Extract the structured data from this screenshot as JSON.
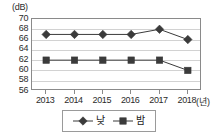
{
  "chart_data": {
    "type": "line",
    "title": "",
    "subtitle": "",
    "xlabel": "(년)",
    "ylabel": "(dB)",
    "categories": [
      "2013",
      "2014",
      "2015",
      "2016",
      "2017",
      "2018"
    ],
    "x": [
      2013,
      2014,
      2015,
      2016,
      2017,
      2018
    ],
    "series": [
      {
        "name": "낮",
        "marker": "diamond",
        "color": "#3b3b3b",
        "values": [
          67,
          67,
          67,
          67,
          68,
          66
        ]
      },
      {
        "name": "밤",
        "marker": "square",
        "color": "#3b3b3b",
        "values": [
          62,
          62,
          62,
          62,
          62,
          60
        ]
      }
    ],
    "ylim": [
      56,
      70
    ],
    "y_ticks": [
      70,
      68,
      66,
      64,
      62,
      60,
      58,
      56
    ],
    "grid": true,
    "legend_position": "bottom",
    "annotations": []
  },
  "axes": {
    "y_unit_label": "(dB)",
    "x_unit_label": "(년)"
  },
  "colors": {
    "axis": "#8a8a8a",
    "grid": "#d2d2d2",
    "series": "#3b3b3b",
    "text": "#2b2b2b",
    "background": "#ffffff"
  }
}
